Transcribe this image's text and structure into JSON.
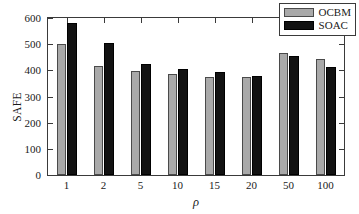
{
  "chart_data": {
    "type": "bar",
    "title": "",
    "xlabel": "ρ",
    "ylabel": "SAFE",
    "categories": [
      "1",
      "2",
      "5",
      "10",
      "15",
      "20",
      "50",
      "100"
    ],
    "series": [
      {
        "name": "OCBM",
        "color": "#a9a9a9",
        "values": [
          500,
          417,
          396,
          385,
          376,
          373,
          467,
          443
        ]
      },
      {
        "name": "SOAC",
        "color": "#121212",
        "values": [
          582,
          503,
          423,
          406,
          393,
          380,
          455,
          413
        ]
      }
    ],
    "ylim": [
      0,
      600
    ],
    "yticks": [
      0,
      100,
      200,
      300,
      400,
      500,
      600
    ],
    "ytick_labels": [
      "0",
      "100",
      "200",
      "300",
      "400",
      "500",
      "600"
    ],
    "grid": false,
    "legend_position": "top-right"
  },
  "legend": {
    "entries": [
      {
        "label": "OCBM"
      },
      {
        "label": "SOAC"
      }
    ]
  }
}
